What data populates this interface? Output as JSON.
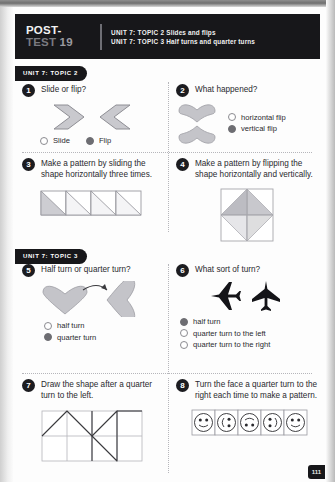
{
  "banner": {
    "post_label": "POST-",
    "test_label": "TEST",
    "test_number": "19",
    "line1_unit": "UNIT 7: TOPIC 2",
    "line1_desc": "Slides and flips",
    "line2_unit": "UNIT 7: TOPIC 3",
    "line2_desc": "Half turns and quarter turns"
  },
  "sections": {
    "topic2_tag": "UNIT 7: TOPIC 2",
    "topic3_tag": "UNIT 7: TOPIC 3"
  },
  "questions": [
    {
      "number": "1",
      "prompt": "Slide or flip?",
      "options": [
        {
          "label": "Slide",
          "selected": false
        },
        {
          "label": "Flip",
          "selected": true
        }
      ]
    },
    {
      "number": "2",
      "prompt": "What happened?",
      "options": [
        {
          "label": "horizontal flip",
          "selected": false
        },
        {
          "label": "vertical flip",
          "selected": true
        }
      ]
    },
    {
      "number": "3",
      "prompt": "Make a pattern by sliding the shape horizontally three times."
    },
    {
      "number": "4",
      "prompt": "Make a pattern by flipping the shape horizontally and vertically."
    },
    {
      "number": "5",
      "prompt": "Half turn or quarter turn?",
      "options": [
        {
          "label": "half turn",
          "selected": false
        },
        {
          "label": "quarter turn",
          "selected": true
        }
      ]
    },
    {
      "number": "6",
      "prompt": "What sort of turn?",
      "options": [
        {
          "label": "half turn",
          "selected": true
        },
        {
          "label": "quarter turn to the left",
          "selected": false
        },
        {
          "label": "quarter turn to the right",
          "selected": false
        }
      ]
    },
    {
      "number": "7",
      "prompt": "Draw the shape after a quarter turn to the left."
    },
    {
      "number": "8",
      "prompt": "Turn the face a quarter turn to the right each time to make a pattern."
    }
  ],
  "page_number": "111",
  "colors": {
    "banner_bg": "#17171a",
    "shape_fill": "#c9c9ce",
    "shape_stroke": "#8e8e94",
    "radio_selected": "#6d6d72",
    "text": "#2a2a2e"
  }
}
